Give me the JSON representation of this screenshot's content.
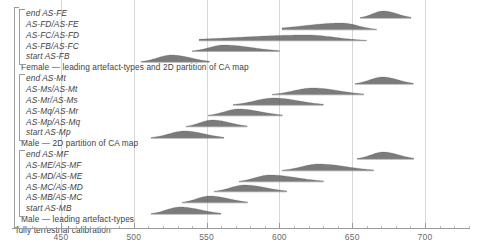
{
  "chart_data": {
    "type": "area",
    "title": "",
    "xlabel": "",
    "ylabel": "",
    "xlim": [
      431,
      735
    ],
    "grid": true,
    "legend": "none",
    "axis": {
      "ticks": [
        450,
        500,
        550,
        600,
        650,
        700
      ],
      "tick_labels": [
        "450",
        "500",
        "550",
        "600",
        "650",
        "700"
      ],
      "minor_step": 10
    },
    "groups": [
      {
        "label": "Female — leading artefact-types and 2D partition of CA map",
        "rows": [
          {
            "label": "end AS-FE",
            "mode": 671,
            "lo": 655,
            "hi": 690,
            "skew": 0.1,
            "height": 1.0
          },
          {
            "label": "AS-FD/AS-FE",
            "mode": 643,
            "lo": 602,
            "hi": 667,
            "skew": -0.45,
            "height": 0.95
          },
          {
            "label": "AS-FC/AS-FD",
            "mode": 619,
            "lo": 545,
            "hi": 660,
            "skew": -0.55,
            "height": 0.8
          },
          {
            "label": "AS-FB/AS-FC",
            "mode": 562,
            "lo": 540,
            "hi": 600,
            "skew": 0.35,
            "height": 0.9
          },
          {
            "label": "start AS-FB",
            "mode": 526,
            "lo": 505,
            "hi": 552,
            "skew": 0.15,
            "height": 1.0
          }
        ]
      },
      {
        "label": "Male — 2D partition of CA map",
        "rows": [
          {
            "label": "end AS-Mt",
            "mode": 671,
            "lo": 652,
            "hi": 692,
            "skew": 0.05,
            "height": 1.0
          },
          {
            "label": "AS-Ms/AS-Mt",
            "mode": 623,
            "lo": 595,
            "hi": 658,
            "skew": 0.2,
            "height": 0.95
          },
          {
            "label": "AS-Mr/AS-Ms",
            "mode": 596,
            "lo": 568,
            "hi": 630,
            "skew": 0.2,
            "height": 1.0
          },
          {
            "label": "AS-Mq/AS-Mr",
            "mode": 572,
            "lo": 551,
            "hi": 602,
            "skew": 0.25,
            "height": 0.95
          },
          {
            "label": "AS-Mp/AS-Mq",
            "mode": 554,
            "lo": 536,
            "hi": 578,
            "skew": 0.2,
            "height": 0.95
          },
          {
            "label": "start AS-Mp",
            "mode": 535,
            "lo": 512,
            "hi": 562,
            "skew": 0.15,
            "height": 1.0
          }
        ]
      },
      {
        "label": "Male — leading artefact-types",
        "rows": [
          {
            "label": "end AS-MF",
            "mode": 671,
            "lo": 653,
            "hi": 692,
            "skew": 0.05,
            "height": 1.0
          },
          {
            "label": "AS-ME/AS-MF",
            "mode": 627,
            "lo": 602,
            "hi": 665,
            "skew": 0.3,
            "height": 0.95
          },
          {
            "label": "AS-MD/AS-ME",
            "mode": 593,
            "lo": 572,
            "hi": 630,
            "skew": 0.3,
            "height": 0.95
          },
          {
            "label": "AS-MC/AS-MD",
            "mode": 576,
            "lo": 555,
            "hi": 605,
            "skew": 0.25,
            "height": 0.95
          },
          {
            "label": "AS-MB/AS-MC",
            "mode": 552,
            "lo": 533,
            "hi": 578,
            "skew": 0.2,
            "height": 0.95
          },
          {
            "label": "start AS-MB",
            "mode": 532,
            "lo": 512,
            "hi": 560,
            "skew": 0.15,
            "height": 1.0
          }
        ]
      }
    ],
    "overall_label": "fully terrestrial calibration",
    "colors": {
      "density_fill": "#5a5a5a",
      "gridline": "#d7d7d7",
      "axis": "#9a9a9a",
      "text": "#3f3f3f",
      "bracket": "#9c9c9c"
    }
  }
}
